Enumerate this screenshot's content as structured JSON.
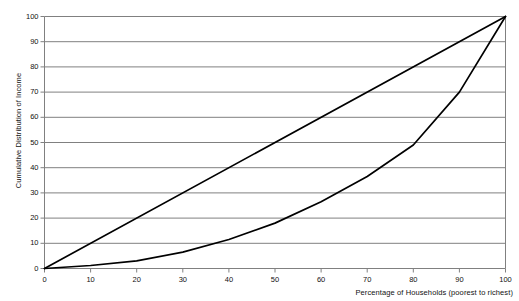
{
  "chart_data": {
    "type": "line",
    "title": "",
    "xlabel": "Percentage of Households (poorest to richest)",
    "ylabel": "Cumulative Distribution of Income",
    "xlim": [
      0,
      100
    ],
    "ylim": [
      0,
      100
    ],
    "xticks": [
      0,
      10,
      20,
      30,
      40,
      50,
      60,
      70,
      80,
      90,
      100
    ],
    "yticks": [
      0,
      10,
      20,
      30,
      40,
      50,
      60,
      70,
      80,
      90,
      100
    ],
    "grid": "horizontal",
    "legend": "none",
    "line_color": "#000000",
    "grid_color": "#808080",
    "axis_color": "#808080",
    "series": [
      {
        "name": "Line of Perfect Equality",
        "x": [
          0,
          100
        ],
        "values": [
          0,
          100
        ]
      },
      {
        "name": "Lorenz Curve",
        "x": [
          0,
          10,
          20,
          30,
          40,
          50,
          60,
          70,
          80,
          90,
          100
        ],
        "values": [
          0,
          1.2,
          3,
          6.5,
          11.5,
          18,
          26.5,
          36.5,
          49,
          70,
          100
        ]
      }
    ]
  },
  "axes": {
    "y_title": "Cumulative Distribution of Income",
    "x_title": "Percentage of Households (poorest to richest)",
    "y_tick_labels": [
      "0",
      "10",
      "20",
      "30",
      "40",
      "50",
      "60",
      "70",
      "80",
      "90",
      "100"
    ],
    "x_tick_labels": [
      "0",
      "10",
      "20",
      "30",
      "40",
      "50",
      "60",
      "70",
      "80",
      "90",
      "100"
    ]
  }
}
